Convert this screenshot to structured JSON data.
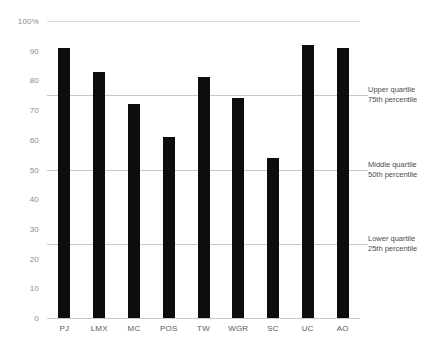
{
  "chart_data": {
    "type": "bar",
    "title": "",
    "xlabel": "",
    "ylabel": "",
    "ylim": [
      0,
      100
    ],
    "grid": true,
    "legend_position": "none",
    "categories": [
      "PJ",
      "LMX",
      "MC",
      "POS",
      "TW",
      "WGR",
      "SC",
      "UC",
      "AO"
    ],
    "values": [
      91,
      83,
      72,
      61,
      81,
      74,
      54,
      92,
      91
    ],
    "y_ticks": [
      {
        "value": 100,
        "label": "100%"
      },
      {
        "value": 90,
        "label": "90"
      },
      {
        "value": 80,
        "label": "80"
      },
      {
        "value": 70,
        "label": "70"
      },
      {
        "value": 60,
        "label": "60"
      },
      {
        "value": 50,
        "label": "50"
      },
      {
        "value": 40,
        "label": "40"
      },
      {
        "value": 30,
        "label": "30"
      },
      {
        "value": 20,
        "label": "20"
      },
      {
        "value": 10,
        "label": "10"
      },
      {
        "value": 0,
        "label": "0"
      }
    ],
    "reference_lines": [
      {
        "value": 75,
        "title": "Upper quartile",
        "subtitle": "75th percentile"
      },
      {
        "value": 50,
        "title": "Middle quartile",
        "subtitle": "50th percentile"
      },
      {
        "value": 25,
        "title": "Lower quartile",
        "subtitle": "25th percentile"
      }
    ],
    "colors": {
      "bar": "#0d0d0d",
      "gridline": "#d9d9d9",
      "reference_line": "#c8c8c8",
      "tick_label": "#8c8c8c",
      "category_label": "#595959",
      "annotation_text": "#4d4d4d",
      "background": "#ffffff"
    }
  }
}
